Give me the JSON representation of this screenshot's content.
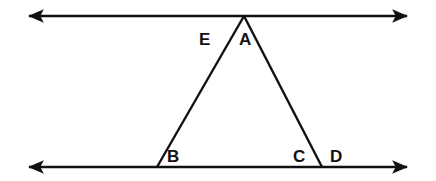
{
  "figure": {
    "background_color": "#ffffff",
    "stroke_color": "#111111",
    "label_color": "#111111",
    "width": 436,
    "height": 181
  },
  "lines": [
    {
      "name": "upper-parallel-line",
      "label": "upper line",
      "x1": 29,
      "y1": 16,
      "x2": 407,
      "y2": 16,
      "arrows": "both",
      "stroke_width": 2.4
    },
    {
      "name": "lower-parallel-line",
      "label": "lower line",
      "x1": 29,
      "y1": 167,
      "x2": 407,
      "y2": 167,
      "arrows": "both",
      "stroke_width": 2.4
    }
  ],
  "triangle": {
    "name": "triangle-ABС",
    "apex": {
      "x": 244,
      "y": 16
    },
    "left_base": {
      "x": 157,
      "y": 167
    },
    "right_base": {
      "x": 322,
      "y": 167
    },
    "stroke_width": 2.4,
    "sides": [
      {
        "name": "left-leg",
        "from": "apex",
        "to": "left_base"
      },
      {
        "name": "right-leg",
        "from": "apex",
        "to": "right_base"
      }
    ]
  },
  "labels": [
    {
      "id": "E",
      "text": "E",
      "x": 199,
      "y": 31,
      "name": "vertex-label-E"
    },
    {
      "id": "A",
      "text": "A",
      "x": 239,
      "y": 31,
      "name": "vertex-label-A"
    },
    {
      "id": "B",
      "text": "B",
      "x": 167,
      "y": 148,
      "name": "vertex-label-B"
    },
    {
      "id": "C",
      "text": "C",
      "x": 293,
      "y": 148,
      "name": "vertex-label-C"
    },
    {
      "id": "D",
      "text": "D",
      "x": 330,
      "y": 148,
      "name": "vertex-label-D"
    }
  ]
}
